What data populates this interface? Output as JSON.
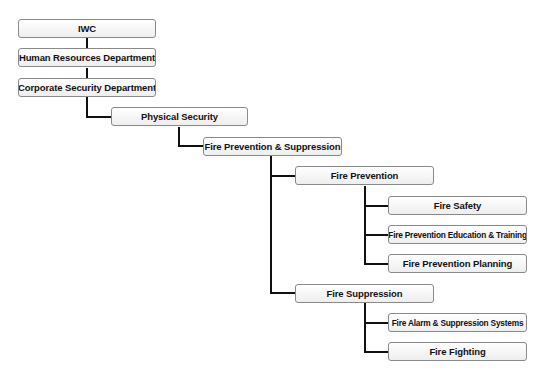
{
  "diagram": {
    "type": "org-chart",
    "colors": {
      "line": "#111111",
      "box_border": "#8a8a8a",
      "box_fill": "#f6f6f6",
      "text": "#111111"
    },
    "nodes": [
      {
        "id": "iwc",
        "label": "IWC",
        "parent": null
      },
      {
        "id": "hr",
        "label": "Human Resources Department",
        "parent": "iwc"
      },
      {
        "id": "corp",
        "label": "Corporate Security Department",
        "parent": "hr"
      },
      {
        "id": "phys",
        "label": "Physical Security",
        "parent": "corp"
      },
      {
        "id": "fps",
        "label": "Fire Prevention & Suppression",
        "parent": "phys"
      },
      {
        "id": "fp",
        "label": "Fire Prevention",
        "parent": "fps"
      },
      {
        "id": "fs",
        "label": "Fire Safety",
        "parent": "fp"
      },
      {
        "id": "fpet",
        "label": "Fire Prevention Education & Training",
        "parent": "fp"
      },
      {
        "id": "fpp",
        "label": "Fire Prevention Planning",
        "parent": "fp"
      },
      {
        "id": "fsup",
        "label": "Fire Suppression",
        "parent": "fps"
      },
      {
        "id": "fass",
        "label": "Fire Alarm & Suppression Systems",
        "parent": "fsup"
      },
      {
        "id": "ff",
        "label": "Fire Fighting",
        "parent": "fsup"
      }
    ]
  }
}
